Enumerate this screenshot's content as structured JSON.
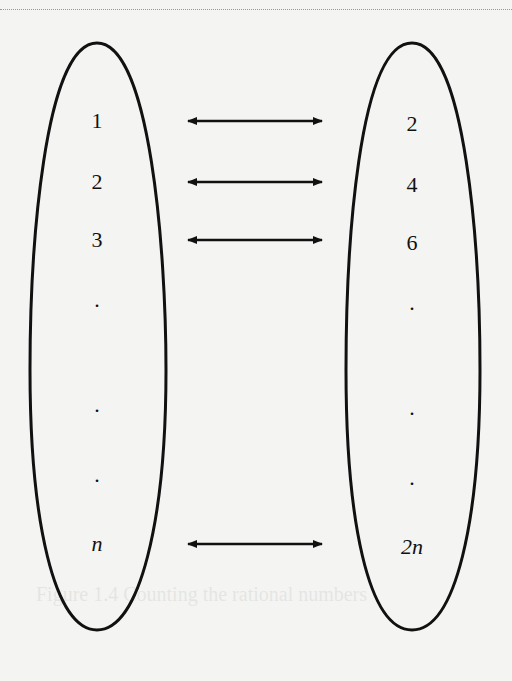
{
  "diagram": {
    "type": "bijection",
    "left_set": [
      "1",
      "2",
      "3",
      ".",
      ".",
      ".",
      "n"
    ],
    "right_set": [
      "2",
      "4",
      "6",
      ".",
      ".",
      ".",
      "2n"
    ],
    "arrow_rows": [
      0,
      1,
      2,
      6
    ],
    "ghost_caption": "Figure 1.4 Counting the rational numbers"
  }
}
